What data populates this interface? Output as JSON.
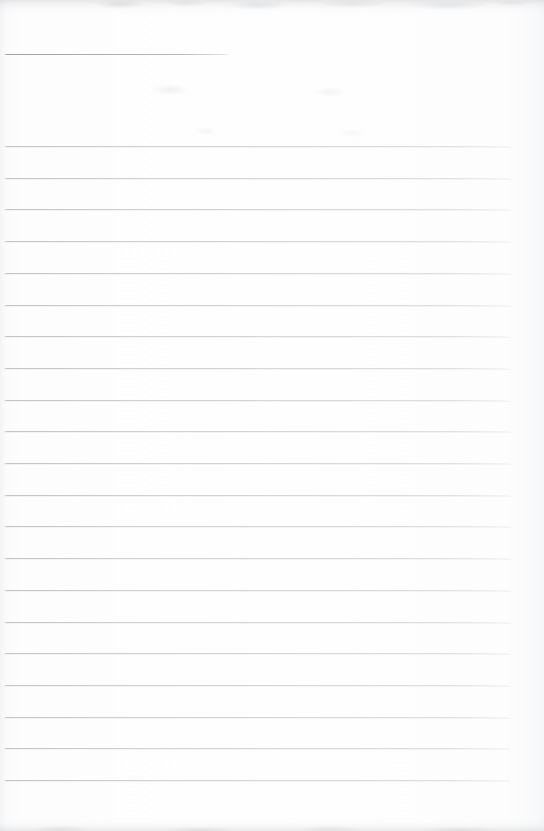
{
  "document": {
    "kind": "scanned-ruled-notebook-page",
    "description": "Blank lined notebook page, scanned",
    "text_content": "",
    "page_width": 544,
    "page_height": 831,
    "paper_color": "#fdfdfd",
    "rule_color": "#c5c9cd",
    "header_rule_color": "#9aa0a6"
  },
  "rules": {
    "header_rule": {
      "label": "header-rule",
      "y": 54,
      "x_start": 4,
      "x_end": 230,
      "length": 226
    },
    "body_rule_x_start": 4,
    "body_rule_x_end": 511,
    "body_rule_length": 507,
    "body_rule_spacing": 31.7,
    "body_rule_count": 21,
    "body_rule_y": [
      146,
      177.7,
      209.4,
      241.1,
      272.8,
      304.5,
      336.2,
      367.9,
      399.6,
      431.3,
      463,
      494.7,
      526.4,
      558.1,
      589.8,
      621.5,
      653.2,
      684.9,
      716.6,
      748.3,
      780
    ]
  }
}
